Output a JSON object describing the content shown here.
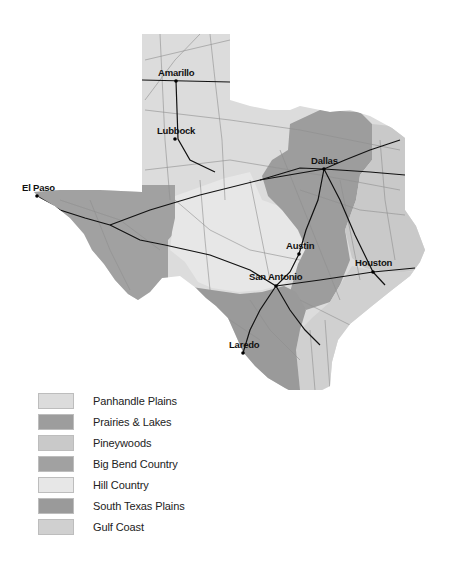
{
  "map": {
    "cities": [
      {
        "name": "Amarillo",
        "x": 176,
        "y": 81,
        "lx": 158,
        "ly": 76
      },
      {
        "name": "Lubbock",
        "x": 175,
        "y": 139,
        "lx": 157,
        "ly": 134
      },
      {
        "name": "El Paso",
        "x": 37,
        "y": 196,
        "lx": 22,
        "ly": 191
      },
      {
        "name": "Dallas",
        "x": 324,
        "y": 169,
        "lx": 311,
        "ly": 164
      },
      {
        "name": "Austin",
        "x": 299,
        "y": 254,
        "lx": 286,
        "ly": 249
      },
      {
        "name": "San Antonio",
        "x": 276,
        "y": 286,
        "lx": 249,
        "ly": 280
      },
      {
        "name": "Houston",
        "x": 373,
        "y": 272,
        "lx": 355,
        "ly": 266
      },
      {
        "name": "Laredo",
        "x": 243,
        "y": 353,
        "lx": 229,
        "ly": 348
      }
    ]
  },
  "legend": {
    "items": [
      {
        "label": "Panhandle Plains",
        "color": "#dcdcdc"
      },
      {
        "label": "Prairies & Lakes",
        "color": "#9d9d9d"
      },
      {
        "label": "Pineywoods",
        "color": "#c9c9c9"
      },
      {
        "label": "Big Bend Country",
        "color": "#a1a1a1"
      },
      {
        "label": "Hill Country",
        "color": "#e7e7e7"
      },
      {
        "label": "South Texas Plains",
        "color": "#9a9a9a"
      },
      {
        "label": "Gulf Coast",
        "color": "#d0d0d0"
      }
    ]
  }
}
